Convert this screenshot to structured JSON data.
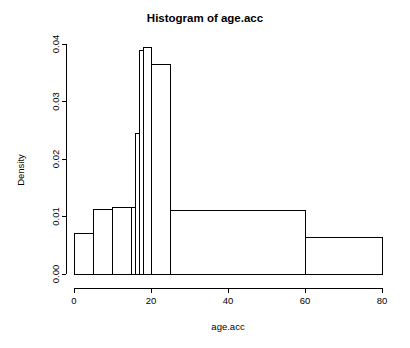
{
  "chart_data": {
    "type": "bar",
    "title": "Histogram of age.acc",
    "xlabel": "age.acc",
    "ylabel": "Density",
    "grid": false,
    "legend": false,
    "xlim": [
      0,
      80
    ],
    "ylim": [
      0.0,
      0.04
    ],
    "xticks": [
      0,
      20,
      40,
      60,
      80
    ],
    "xtick_labels": [
      "0",
      "20",
      "40",
      "60",
      "80"
    ],
    "yticks": [
      0.0,
      0.01,
      0.02,
      0.03,
      0.04
    ],
    "ytick_labels": [
      "0.00",
      "0.01",
      "0.02",
      "0.03",
      "0.04"
    ],
    "bin_edges": [
      0,
      5,
      10,
      15,
      16,
      17,
      18,
      20,
      25,
      60,
      80
    ],
    "categories": [
      "0-5",
      "5-10",
      "10-15",
      "15-16",
      "16-17",
      "17-18",
      "18-20",
      "20-25",
      "25-60",
      "60-80"
    ],
    "values": [
      0.007,
      0.0112,
      0.0116,
      0.0116,
      0.0244,
      0.0388,
      0.0394,
      0.0365,
      0.0111,
      0.0064
    ],
    "bars": [
      {
        "x0": 0,
        "x1": 5,
        "density": 0.007
      },
      {
        "x0": 5,
        "x1": 10,
        "density": 0.0112
      },
      {
        "x0": 10,
        "x1": 15,
        "density": 0.0116
      },
      {
        "x0": 15,
        "x1": 16,
        "density": 0.0116
      },
      {
        "x0": 16,
        "x1": 17,
        "density": 0.0244
      },
      {
        "x0": 17,
        "x1": 18,
        "density": 0.0388
      },
      {
        "x0": 18,
        "x1": 20,
        "density": 0.0394
      },
      {
        "x0": 20,
        "x1": 25,
        "density": 0.0365
      },
      {
        "x0": 25,
        "x1": 60,
        "density": 0.0111
      },
      {
        "x0": 60,
        "x1": 80,
        "density": 0.0064
      }
    ],
    "colors": {
      "bar_stroke": "#000000",
      "bar_fill": "#ffffff",
      "axis": "#000000",
      "background": "#ffffff"
    }
  }
}
